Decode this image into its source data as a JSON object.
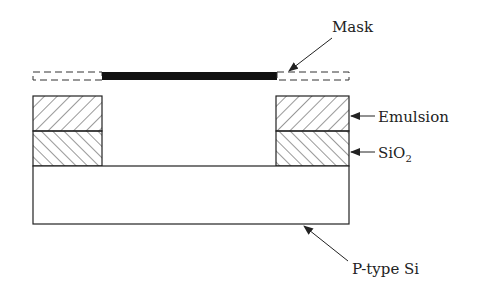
{
  "diagram": {
    "labels": {
      "mask": "Mask",
      "emulsion": "Emulsion",
      "sio2_main": "SiO",
      "sio2_sub": "2",
      "substrate": "P-type Si"
    },
    "colors": {
      "stroke": "#222222",
      "mask_solid": "#111111",
      "background": "#ffffff"
    }
  }
}
